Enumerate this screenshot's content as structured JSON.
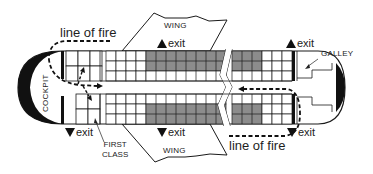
{
  "diagram": {
    "colors": {
      "line": "#1a1a1a",
      "shaded_seat": "#8c8c8c",
      "background": "#ffffff"
    },
    "labels": {
      "line_of_fire_top": "line of fire",
      "line_of_fire_bottom": "line of fire",
      "wing_top": "WING",
      "wing_bottom": "WING",
      "exit_top_wing": "exit",
      "exit_bottom_wing": "exit",
      "exit_bottom_front": "exit",
      "exit_top_rear": "exit",
      "exit_bottom_rear": "exit",
      "cockpit": "COCKPIT",
      "galley": "GALLEY",
      "first_class_line1": "FIRST",
      "first_class_line2": "CLASS"
    },
    "sections": [
      {
        "name": "cockpit"
      },
      {
        "name": "first-class",
        "cols": 3,
        "rows_per_side": 2
      },
      {
        "name": "economy-front",
        "cols": 4,
        "rows_per_side": 3
      },
      {
        "name": "wing-rows",
        "cols": 8,
        "rows_per_side": 2,
        "shaded": true
      },
      {
        "name": "aft-shaded",
        "cols": 3,
        "rows_per_side": 2,
        "shaded": true
      },
      {
        "name": "aft-economy",
        "cols": 3,
        "rows_per_side": 3
      },
      {
        "name": "galley"
      }
    ]
  }
}
